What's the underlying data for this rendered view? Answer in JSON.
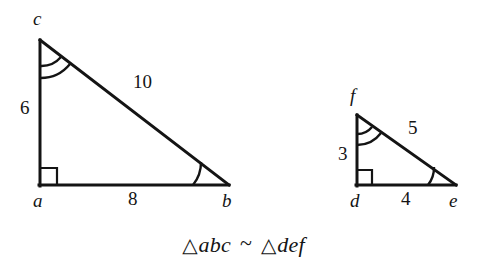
{
  "figure": {
    "kind": "similar-right-triangles",
    "background_color": "#ffffff",
    "stroke_color": "#141414",
    "caption": {
      "triangle_symbol": "△",
      "left_triangle_name": "abc",
      "similarity_symbol": "~",
      "right_triangle_name": "def",
      "full_text": "△abc ~ △def"
    }
  },
  "triangles": [
    {
      "id": "large",
      "name": "abc",
      "vertices": [
        {
          "key": "a",
          "label": "a",
          "role": "right-angle-vertex",
          "x": 40,
          "y": 185,
          "label_x": 33,
          "label_y": 191
        },
        {
          "key": "b",
          "label": "b",
          "role": "acute-vertex",
          "x": 228,
          "y": 185,
          "label_x": 222,
          "label_y": 191
        },
        {
          "key": "c",
          "label": "c",
          "role": "apex-vertex",
          "x": 40,
          "y": 40,
          "label_x": 33,
          "label_y": 9
        }
      ],
      "sides": [
        {
          "key": "ac",
          "label": "6",
          "value": 6,
          "label_x": 20,
          "label_y": 98
        },
        {
          "key": "ab",
          "label": "8",
          "value": 8,
          "label_x": 128,
          "label_y": 189
        },
        {
          "key": "cb",
          "label": "10",
          "value": 10,
          "label_x": 133,
          "label_y": 72
        }
      ],
      "angle_marks": [
        {
          "at": "c",
          "style": "double-arc"
        },
        {
          "at": "b",
          "style": "single-arc"
        },
        {
          "at": "a",
          "style": "right-angle-square"
        }
      ]
    },
    {
      "id": "small",
      "name": "def",
      "vertices": [
        {
          "key": "d",
          "label": "d",
          "role": "right-angle-vertex",
          "x": 357,
          "y": 185,
          "label_x": 350,
          "label_y": 191
        },
        {
          "key": "e",
          "label": "e",
          "role": "acute-vertex",
          "x": 455,
          "y": 185,
          "label_x": 449,
          "label_y": 191
        },
        {
          "key": "f",
          "label": "f",
          "role": "apex-vertex",
          "x": 357,
          "y": 115,
          "label_x": 350,
          "label_y": 86
        }
      ],
      "sides": [
        {
          "key": "df",
          "label": "3",
          "value": 3,
          "label_x": 338,
          "label_y": 144
        },
        {
          "key": "de",
          "label": "4",
          "value": 4,
          "label_x": 401,
          "label_y": 189
        },
        {
          "key": "fe",
          "label": "5",
          "value": 5,
          "label_x": 408,
          "label_y": 118
        }
      ],
      "angle_marks": [
        {
          "at": "f",
          "style": "double-arc"
        },
        {
          "at": "e",
          "style": "single-arc"
        },
        {
          "at": "d",
          "style": "right-angle-square"
        }
      ]
    }
  ]
}
